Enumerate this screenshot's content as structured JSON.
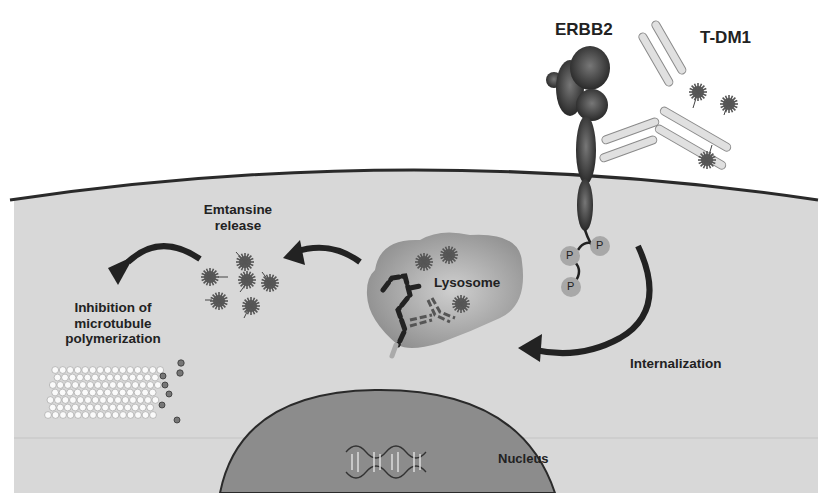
{
  "figure": {
    "labels": {
      "erbb2": "ERBB2",
      "tdm1": "T-DM1",
      "emtansine_release": [
        "Emtansine",
        "release"
      ],
      "inhibition": [
        "Inhibition of",
        "microtubule",
        "polymerization"
      ],
      "lysosome": "Lysosome",
      "internalization": "Internalization",
      "nucleus": "Nucleus",
      "phospho": "P"
    },
    "colors": {
      "background": "#ffffff",
      "cytoplasm": "#d8d8d8",
      "membrane": "#2a2a2a",
      "nucleus": "#8c8c8c",
      "lysosome": "#9a9a9a",
      "receptor": "#3a3a3a",
      "antibody": "#c8c8c8",
      "arrow": "#222222",
      "drug": "#6e6e6e",
      "phospho": "#a8a8a8"
    },
    "nodes": [
      "ERBB2",
      "T-DM1",
      "Lysosome",
      "Emtansine release",
      "Inhibition of microtubule polymerization",
      "Nucleus"
    ],
    "edges": [
      {
        "from": "ERBB2/T-DM1 complex",
        "to": "Lysosome",
        "label": "Internalization"
      },
      {
        "from": "Lysosome",
        "to": "Emtansine release"
      },
      {
        "from": "Emtansine release",
        "to": "Inhibition of microtubule polymerization"
      }
    ]
  }
}
